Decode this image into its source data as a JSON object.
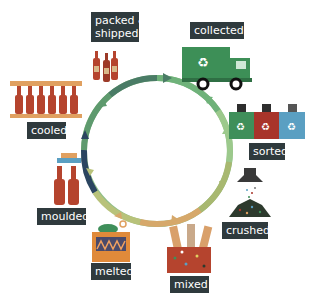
{
  "diagram": {
    "type": "cycle",
    "stages": [
      {
        "id": "collected",
        "label": "collected",
        "icon": "recycling-truck-icon"
      },
      {
        "id": "sorted",
        "label": "sorted",
        "icon": "recycling-bins-icon"
      },
      {
        "id": "crushed",
        "label": "crushed",
        "icon": "crusher-icon"
      },
      {
        "id": "mixed",
        "label": "mixed",
        "icon": "mixing-tubes-icon"
      },
      {
        "id": "melted",
        "label": "melted",
        "icon": "furnace-icon"
      },
      {
        "id": "moulded",
        "label": "moulded",
        "icon": "bottle-mould-icon"
      },
      {
        "id": "cooled",
        "label": "cooled",
        "icon": "bottle-rack-icon"
      },
      {
        "id": "packed",
        "label_line1": "packed &",
        "label_line2": "shipped",
        "icon": "bottles-icon"
      }
    ],
    "colors": {
      "label_bg": "#2f3a3d",
      "ring_green": "#5fae6a",
      "ring_light": "#a9c98a",
      "ring_orange": "#e0a060",
      "ring_dark": "#2a4a6a",
      "bottle": "#b5442e",
      "truck": "#3d8f57",
      "bin_green": "#3f8f5a",
      "bin_red": "#a8342a",
      "bin_blue": "#5a9fc2",
      "furnace": "#e08a3a"
    }
  }
}
